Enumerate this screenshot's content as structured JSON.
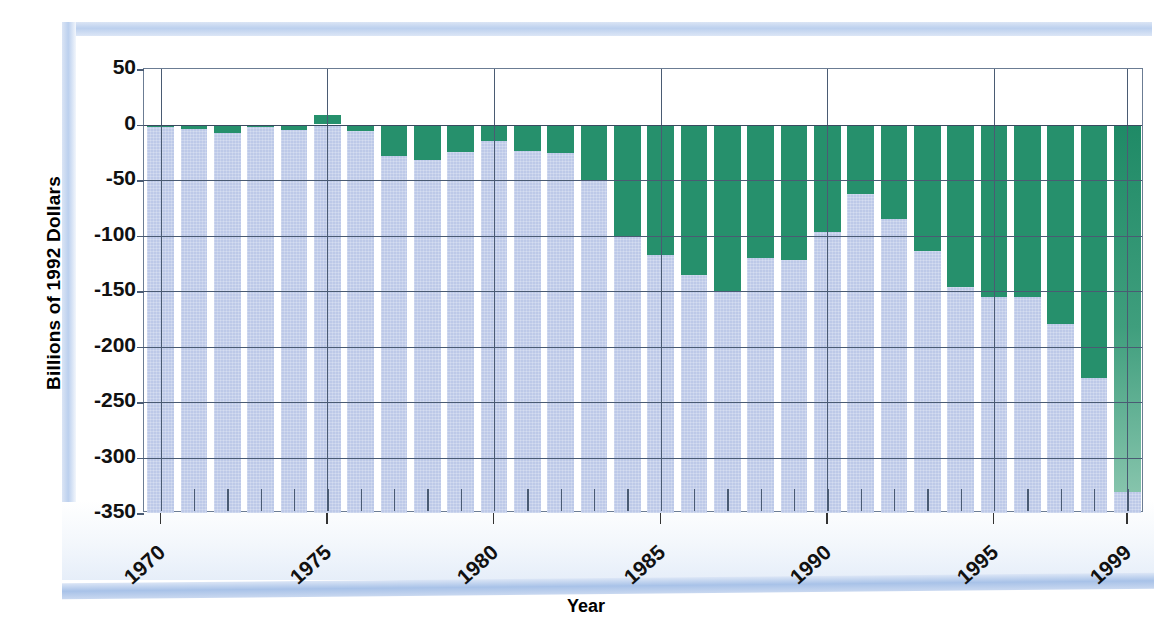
{
  "chart_data": {
    "type": "bar",
    "title": "",
    "xlabel": "Year",
    "ylabel": "Billions of 1992 Dollars",
    "ylim": [
      -350,
      50
    ],
    "yticks": [
      50,
      0,
      -50,
      -100,
      -150,
      -200,
      -250,
      -300,
      -350
    ],
    "ytick_labels": [
      "50",
      "0",
      "-50",
      "-100",
      "-150",
      "-200",
      "-250",
      "-300",
      "-350"
    ],
    "xtick_labels": [
      "1970",
      "1975",
      "1980",
      "1985",
      "1990",
      "1995",
      "1999"
    ],
    "xtick_years": [
      1970,
      1975,
      1980,
      1985,
      1990,
      1995,
      1999
    ],
    "grid": true,
    "legend": "none",
    "categories": [
      "1970",
      "1971",
      "1972",
      "1973",
      "1974",
      "1975",
      "1976",
      "1977",
      "1978",
      "1979",
      "1980",
      "1981",
      "1982",
      "1983",
      "1984",
      "1985",
      "1986",
      "1987",
      "1988",
      "1989",
      "1990",
      "1991",
      "1992",
      "1993",
      "1994",
      "1995",
      "1996",
      "1997",
      "1998",
      "1999"
    ],
    "values": [
      -2,
      -4,
      -8,
      -2,
      -5,
      9,
      -6,
      -28,
      -32,
      -25,
      -15,
      -24,
      -26,
      -50,
      -100,
      -118,
      -136,
      -150,
      -120,
      -122,
      -97,
      -63,
      -85,
      -114,
      -146,
      -155,
      -155,
      -180,
      -228,
      -331
    ],
    "series": [
      {
        "name": "Trade balance",
        "color": "#26906c",
        "values": [
          -2,
          -4,
          -8,
          -2,
          -5,
          9,
          -6,
          -28,
          -32,
          -25,
          -15,
          -24,
          -26,
          -50,
          -100,
          -118,
          -136,
          -150,
          -120,
          -122,
          -97,
          -63,
          -85,
          -114,
          -146,
          -155,
          -155,
          -180,
          -228,
          -331
        ]
      }
    ],
    "bar_shadow_color": "#bdc9e8",
    "bar_color": "#26906c",
    "axis_color": "#4a5b73",
    "frame_color": "#bcd0ee"
  },
  "labels": {
    "y_axis_title": "Billions of 1992 Dollars",
    "x_axis_title": "Year"
  }
}
